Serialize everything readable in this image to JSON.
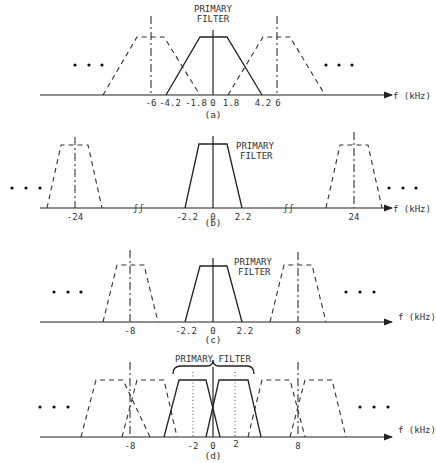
{
  "axis_label": "f (kHz)",
  "primary_filter_label": [
    "PRIMARY",
    "FILTER"
  ],
  "primary_filter_label_inline": "PRIMARY FILTER",
  "ellipsis": "• • •",
  "panels": [
    {
      "caption": "(a)",
      "tick_labels": [
        "-6",
        "-4.2",
        "-1.8",
        "0",
        "1.8",
        "4.2",
        "6"
      ],
      "description": "Primary filter passband -4.2 to 4.2 kHz overlapping images centered at ±6 kHz"
    },
    {
      "caption": "(b)",
      "tick_labels": [
        "-24",
        "-2.2",
        "0",
        "2.2",
        "24"
      ],
      "description": "Primary filter -2.2 to 2.2 kHz, images at ±24 kHz, broken axis"
    },
    {
      "caption": "(c)",
      "tick_labels": [
        "-8",
        "-2.2",
        "0",
        "2.2",
        "8"
      ],
      "description": "Primary filter -2.2 to 2.2 kHz, images at ±8 kHz"
    },
    {
      "caption": "(d)",
      "tick_labels": [
        "-8",
        "-2",
        "0",
        "2",
        "8"
      ],
      "description": "Two primary filters centered at ±2 kHz, images around ±8 kHz"
    }
  ],
  "colors": {
    "ink": "#222222",
    "background": "#ffffff"
  }
}
